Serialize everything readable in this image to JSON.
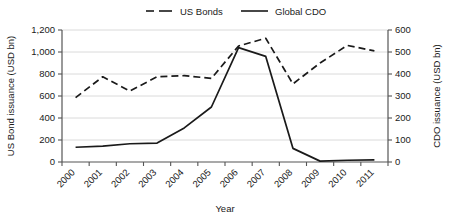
{
  "chart_data": {
    "type": "line",
    "title": "",
    "xlabel": "Year",
    "categories": [
      "2000",
      "2001",
      "2002",
      "2003",
      "2004",
      "2005",
      "2006",
      "2007",
      "2008",
      "2009",
      "2010",
      "2011"
    ],
    "grid": true,
    "legend_position": "top-center",
    "axes": {
      "left": {
        "label": "US Bond issuance (USD bn)",
        "ticks": [
          "0",
          "200",
          "400",
          "600",
          "800",
          "1,000",
          "1,200"
        ],
        "tick_values": [
          0,
          200,
          400,
          600,
          800,
          1000,
          1200
        ],
        "ylim": [
          0,
          1200
        ]
      },
      "right": {
        "label": "CDO issuance (USD bn)",
        "ticks": [
          "0",
          "100",
          "200",
          "300",
          "400",
          "500",
          "600"
        ],
        "tick_values": [
          0,
          100,
          200,
          300,
          400,
          500,
          600
        ],
        "ylim": [
          0,
          600
        ]
      },
      "x": {
        "label": "Year",
        "tick_rotation": -45
      }
    },
    "series": [
      {
        "name": "US Bonds",
        "axis": "left",
        "style": "dashed",
        "color": "#1a1a1a",
        "values": [
          585,
          775,
          645,
          775,
          785,
          760,
          1055,
          1125,
          710,
          900,
          1060,
          1010
        ]
      },
      {
        "name": "Global CDO",
        "axis": "right",
        "style": "solid",
        "color": "#1a1a1a",
        "values": [
          67,
          72,
          83,
          86,
          155,
          250,
          520,
          480,
          62,
          4,
          8,
          10
        ]
      }
    ]
  },
  "legend": {
    "items": [
      {
        "label": "US Bonds",
        "style": "dashed"
      },
      {
        "label": "Global CDO",
        "style": "solid"
      }
    ]
  }
}
